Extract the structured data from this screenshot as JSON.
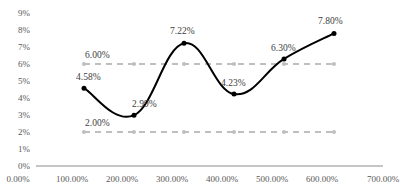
{
  "chart_data": {
    "type": "line",
    "title": "",
    "xlabel": "",
    "ylabel": "",
    "x": [
      1.0,
      2.0,
      3.0,
      4.0,
      5.0,
      6.0
    ],
    "series": [
      {
        "name": "Value",
        "style": "smooth-solid",
        "color": "#000000",
        "values": [
          4.58,
          2.99,
          7.22,
          4.23,
          6.3,
          7.8
        ],
        "labels": [
          "4.58%",
          "2.99%",
          "7.22%",
          "4.23%",
          "6.30%",
          "7.80%"
        ]
      },
      {
        "name": "Upper limit",
        "style": "dashed",
        "color": "#bfbfbf",
        "values": [
          6.0,
          6.0,
          6.0,
          6.0,
          6.0,
          6.0
        ],
        "labels": [
          "6.00%"
        ]
      },
      {
        "name": "Lower limit",
        "style": "dashed",
        "color": "#bfbfbf",
        "values": [
          2.0,
          2.0,
          2.0,
          2.0,
          2.0,
          2.0
        ],
        "labels": [
          "2.00%"
        ]
      }
    ],
    "xlim": [
      0,
      7
    ],
    "ylim": [
      0,
      9
    ],
    "x_tick_labels": [
      "0.00%",
      "100.00%",
      "200.00%",
      "300.00%",
      "400.00%",
      "500.00%",
      "600.00%",
      "700.00%"
    ],
    "y_tick_labels": [
      "0%",
      "1%",
      "2%",
      "3%",
      "4%",
      "5%",
      "6%",
      "7%",
      "8%",
      "9%"
    ],
    "grid": false,
    "legend": "none"
  }
}
